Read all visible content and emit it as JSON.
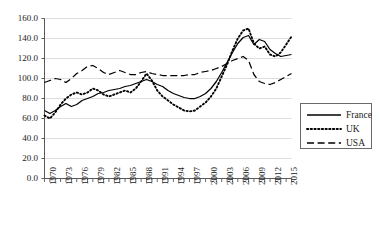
{
  "chart_data": {
    "type": "line",
    "title": "",
    "xlabel": "",
    "ylabel": "",
    "ylim": [
      0.0,
      160.0
    ],
    "ytick_step": 20.0,
    "ytick_labels": [
      "0.0",
      "20.0",
      "40.0",
      "60.0",
      "80.0",
      "100.0",
      "120.0",
      "140.0",
      "160.0"
    ],
    "grid": true,
    "grid_axis": "y",
    "legend_position": "right",
    "x_start": 1970,
    "x_end": 2016,
    "xtick_label_every": 3,
    "xtick_labels": [
      "1970",
      "1973",
      "1976",
      "1979",
      "1982",
      "1985",
      "1988",
      "1991",
      "1994",
      "1997",
      "2000",
      "2003",
      "2006",
      "2009",
      "2012",
      "2015"
    ],
    "x": [
      1970,
      1971,
      1972,
      1973,
      1974,
      1975,
      1976,
      1977,
      1978,
      1979,
      1980,
      1981,
      1982,
      1983,
      1984,
      1985,
      1986,
      1987,
      1988,
      1989,
      1990,
      1991,
      1992,
      1993,
      1994,
      1995,
      1996,
      1997,
      1998,
      1999,
      2000,
      2001,
      2002,
      2003,
      2004,
      2005,
      2006,
      2007,
      2008,
      2009,
      2010,
      2011,
      2012,
      2013,
      2014,
      2015,
      2016
    ],
    "series": [
      {
        "name": "France",
        "style": "solid",
        "color": "#000000",
        "values": [
          68,
          65,
          68,
          72,
          75,
          72,
          74,
          78,
          80,
          82,
          85,
          86,
          88,
          89,
          90,
          92,
          93,
          95,
          97,
          99,
          97,
          94,
          92,
          88,
          85,
          83,
          81,
          80,
          80,
          82,
          85,
          90,
          97,
          106,
          116,
          126,
          135,
          141,
          143,
          134,
          139,
          137,
          129,
          125,
          122,
          123,
          124
        ]
      },
      {
        "name": "UK",
        "style": "dotted",
        "color": "#000000",
        "values": [
          63,
          60,
          66,
          74,
          80,
          84,
          86,
          84,
          86,
          90,
          88,
          84,
          82,
          84,
          86,
          88,
          86,
          90,
          97,
          105,
          98,
          88,
          82,
          78,
          74,
          71,
          68,
          67,
          68,
          72,
          76,
          82,
          90,
          102,
          114,
          128,
          140,
          148,
          150,
          135,
          130,
          132,
          124,
          122,
          126,
          134,
          142
        ]
      },
      {
        "name": "USA",
        "style": "dashed",
        "color": "#000000",
        "values": [
          96,
          98,
          100,
          99,
          96,
          100,
          105,
          108,
          112,
          113,
          110,
          106,
          104,
          106,
          108,
          106,
          104,
          104,
          106,
          107,
          105,
          104,
          103,
          103,
          103,
          103,
          103,
          104,
          104,
          106,
          107,
          108,
          110,
          112,
          115,
          118,
          120,
          122,
          118,
          104,
          97,
          95,
          94,
          96,
          99,
          102,
          105
        ]
      }
    ]
  }
}
